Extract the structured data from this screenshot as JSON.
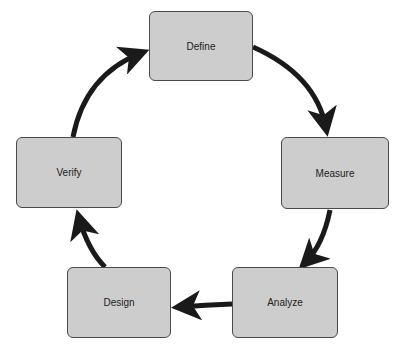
{
  "diagram": {
    "type": "cycle",
    "colors": {
      "node_fill": "#cdcdcd",
      "node_border": "#4a4a4a",
      "arrow": "#1a1a1a",
      "text": "#222222",
      "background": "#ffffff"
    },
    "nodes": [
      {
        "id": "define",
        "label": "Define"
      },
      {
        "id": "measure",
        "label": "Measure"
      },
      {
        "id": "analyze",
        "label": "Analyze"
      },
      {
        "id": "design",
        "label": "Design"
      },
      {
        "id": "verify",
        "label": "Verify"
      }
    ],
    "edges": [
      {
        "from": "define",
        "to": "measure"
      },
      {
        "from": "measure",
        "to": "analyze"
      },
      {
        "from": "analyze",
        "to": "design"
      },
      {
        "from": "design",
        "to": "verify"
      },
      {
        "from": "verify",
        "to": "define"
      }
    ]
  }
}
